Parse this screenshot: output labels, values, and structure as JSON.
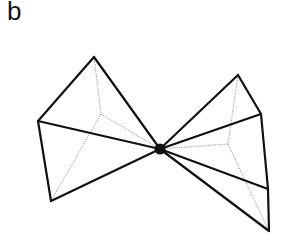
{
  "panel": {
    "label": "b"
  },
  "diagram": {
    "focal_point": {
      "x": 160,
      "y": 149,
      "r": 5,
      "color": "#111111"
    },
    "left_pyramid": {
      "base_corners": [
        {
          "x": 94,
          "y": 57
        },
        {
          "x": 38,
          "y": 121
        },
        {
          "x": 51,
          "y": 201
        }
      ],
      "hidden_corner": {
        "x": 101,
        "y": 114
      }
    },
    "right_pyramid": {
      "base_corners": [
        {
          "x": 238,
          "y": 75
        },
        {
          "x": 261,
          "y": 114
        },
        {
          "x": 268,
          "y": 189
        },
        {
          "x": 269,
          "y": 231
        }
      ],
      "hidden_corner": {
        "x": 228,
        "y": 144
      }
    },
    "colors": {
      "solid_edge": "#111111",
      "hidden_edge": "#9a9a9a"
    }
  }
}
